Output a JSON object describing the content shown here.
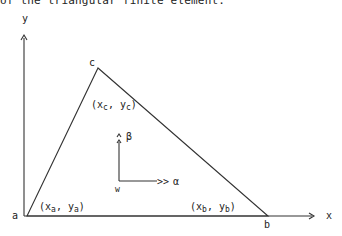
{
  "caption": "of the triangular finite element.",
  "axes": {
    "x_label": "x",
    "y_label": "y"
  },
  "vertices": {
    "a": {
      "name": "a",
      "coord_open": "(x",
      "sub_x": "a",
      "sep": ", y",
      "sub_y": "a",
      "coord_close": ")"
    },
    "b": {
      "name": "b",
      "coord_open": "(x",
      "sub_x": "b",
      "sep": ", y",
      "sub_y": "b",
      "coord_close": ")"
    },
    "c": {
      "name": "c",
      "coord_open": "(x",
      "sub_x": "c",
      "sep": ", y",
      "sub_y": "c",
      "coord_close": ")"
    }
  },
  "local_axes": {
    "origin_label": "w",
    "alpha_label": "α",
    "beta_label": "β",
    "arrow_glyph": ">>",
    "up_glyph": "^"
  }
}
